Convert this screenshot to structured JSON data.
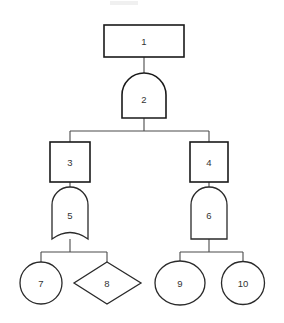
{
  "diagram": {
    "background_color": "#ffffff",
    "stroke_color": "#1a1a1a",
    "connector_color": "#4a4a4a",
    "label_color": "#333333",
    "nodes": [
      {
        "id": "1",
        "label": "1",
        "shape": "rectangle",
        "cx": 144,
        "cy": 41,
        "w": 80,
        "h": 32
      },
      {
        "id": "2",
        "label": "2",
        "shape": "arch-top",
        "cx": 144,
        "cy": 96,
        "w": 44,
        "h": 45
      },
      {
        "id": "3",
        "label": "3",
        "shape": "square",
        "cx": 70,
        "cy": 162,
        "w": 40,
        "h": 40
      },
      {
        "id": "4",
        "label": "4",
        "shape": "square",
        "cx": 209,
        "cy": 162,
        "w": 38,
        "h": 40
      },
      {
        "id": "5",
        "label": "5",
        "shape": "arch-top-concave-bottom",
        "cx": 70,
        "cy": 215,
        "w": 36,
        "h": 48
      },
      {
        "id": "6",
        "label": "6",
        "shape": "arch-top",
        "cx": 209,
        "cy": 215,
        "w": 36,
        "h": 48
      },
      {
        "id": "7",
        "label": "7",
        "shape": "circle",
        "cx": 41,
        "cy": 283,
        "w": 42,
        "h": 42
      },
      {
        "id": "8",
        "label": "8",
        "shape": "diamond",
        "cx": 107,
        "cy": 283,
        "w": 67,
        "h": 42
      },
      {
        "id": "9",
        "label": "9",
        "shape": "ellipse",
        "cx": 180,
        "cy": 283,
        "w": 50,
        "h": 44
      },
      {
        "id": "10",
        "label": "10",
        "shape": "circle",
        "cx": 243,
        "cy": 283,
        "w": 43,
        "h": 43
      }
    ],
    "edges": [
      {
        "from": "1",
        "to": "2",
        "name": "edge-1-2"
      },
      {
        "from": "2",
        "to": "3",
        "name": "edge-2-3"
      },
      {
        "from": "2",
        "to": "4",
        "name": "edge-2-4"
      },
      {
        "from": "3",
        "to": "5",
        "name": "edge-3-5"
      },
      {
        "from": "4",
        "to": "6",
        "name": "edge-4-6"
      },
      {
        "from": "5",
        "to": "7",
        "name": "edge-5-7"
      },
      {
        "from": "5",
        "to": "8",
        "name": "edge-5-8"
      },
      {
        "from": "6",
        "to": "9",
        "name": "edge-6-9"
      },
      {
        "from": "6",
        "to": "10",
        "name": "edge-6-10"
      }
    ]
  }
}
